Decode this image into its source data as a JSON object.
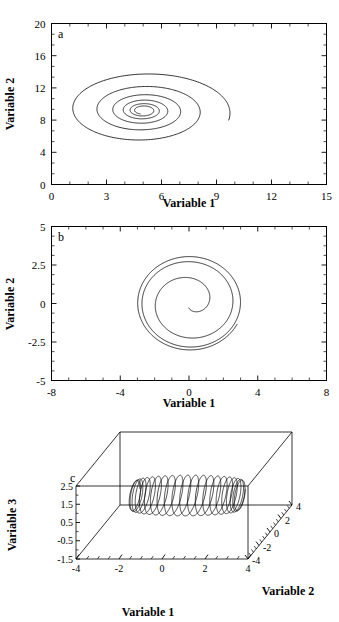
{
  "figure": {
    "panels": [
      "a",
      "b",
      "c"
    ]
  },
  "chart_data": [
    {
      "type": "line",
      "panel": "a",
      "title": "",
      "xlabel": "Variable 1",
      "ylabel": "Variable 2",
      "xlim": [
        0,
        15
      ],
      "ylim": [
        0,
        20
      ],
      "xticks": [
        0,
        3,
        6,
        9,
        12,
        15
      ],
      "yticks": [
        0,
        4,
        8,
        12,
        16,
        20
      ],
      "minor_ticks": true,
      "grid": false,
      "legend": "none",
      "description": "Inward spiral converging to a stable focus",
      "fixed_point": [
        5.0,
        9.2
      ],
      "series": [
        {
          "name": "trajectory",
          "kind": "inward-spiral",
          "start": [
            1.4,
            0.0
          ],
          "center": [
            5.0,
            9.2
          ],
          "max_radius_x": 4.8,
          "max_radius_y": 5.1,
          "turns": 4.6,
          "decay": 0.42
        }
      ]
    },
    {
      "type": "line",
      "panel": "b",
      "title": "",
      "xlabel": "Variable 1",
      "ylabel": "Variable 2",
      "xlim": [
        -8,
        8
      ],
      "ylim": [
        -5,
        5
      ],
      "xticks": [
        -8,
        -4,
        0,
        4,
        8
      ],
      "yticks": [
        -5,
        -2.5,
        0,
        2.5,
        5
      ],
      "minor_ticks": true,
      "grid": false,
      "legend": "none",
      "description": "Outward spiral growing from the origin toward a limit cycle",
      "fixed_point": [
        0,
        0
      ],
      "series": [
        {
          "name": "trajectory",
          "kind": "outward-spiral",
          "center": [
            0.05,
            0.05
          ],
          "start_radius": 0.35,
          "limit_radius": 3.15,
          "turns": 3.2
        }
      ]
    },
    {
      "type": "line",
      "panel": "c",
      "title": "",
      "xlabel": "Variable 1",
      "ylabel": "Variable 3",
      "zlabel": "Variable 2",
      "xlim": [
        -4,
        4
      ],
      "ylim": [
        -1.5,
        2.5
      ],
      "zlim": [
        -4,
        4
      ],
      "xticks": [
        -4,
        -2,
        0,
        2,
        4
      ],
      "yticks": [
        -1.5,
        -0.5,
        0.5,
        1.5,
        2.5
      ],
      "zticks": [
        -4,
        -2,
        0,
        2,
        4
      ],
      "minor_ticks": true,
      "grid": false,
      "legend": "none",
      "projection": "3d-box",
      "description": "Helical coil trajectory with dense spiral knots at both ends",
      "series": [
        {
          "name": "trajectory",
          "kind": "helix-with-end-knots",
          "x_span": [
            -2.3,
            2.6
          ],
          "coil_radius": 1.0,
          "coils": 9
        }
      ]
    }
  ],
  "panel_a": {
    "label": "a",
    "xlabel": "Variable 1",
    "ylabel": "Variable 2",
    "xticks": [
      "0",
      "3",
      "6",
      "9",
      "12",
      "15"
    ],
    "yticks": [
      "0",
      "4",
      "8",
      "12",
      "16",
      "20"
    ]
  },
  "panel_b": {
    "label": "b",
    "xlabel": "Variable 1",
    "ylabel": "Variable 2",
    "xticks": [
      "-8",
      "-4",
      "0",
      "4",
      "8"
    ],
    "yticks": [
      "-5",
      "-2.5",
      "0",
      "2.5",
      "5"
    ]
  },
  "panel_c": {
    "label": "c",
    "xlabel": "Variable 1",
    "ylabel": "Variable 3",
    "zlabel": "Variable 2",
    "xticks": [
      "-4",
      "-2",
      "0",
      "2",
      "4"
    ],
    "yticks": [
      "-1.5",
      "-0.5",
      "0.5",
      "1.5",
      "2.5"
    ],
    "zticks": [
      "-4",
      "-2",
      "0",
      "2",
      "4"
    ]
  },
  "colors": {
    "stroke": "#000000",
    "background": "#ffffff"
  }
}
